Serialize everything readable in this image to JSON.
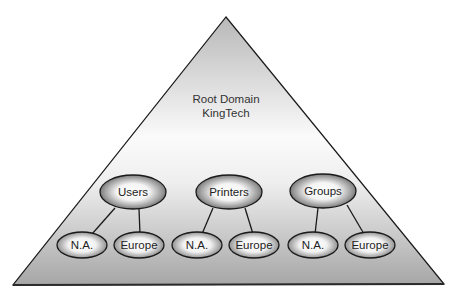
{
  "diagram": {
    "root": {
      "line1": "Root Domain",
      "line2": "KingTech"
    },
    "groups": [
      {
        "label": "Users",
        "children": [
          {
            "label": "N.A."
          },
          {
            "label": "Europe"
          }
        ]
      },
      {
        "label": "Printers",
        "children": [
          {
            "label": "N.A."
          },
          {
            "label": "Europe"
          }
        ]
      },
      {
        "label": "Groups",
        "children": [
          {
            "label": "N.A."
          },
          {
            "label": "Europe"
          }
        ]
      }
    ]
  },
  "colors": {
    "outline": "#1a1a1a",
    "triangle_top": "#bdbdbd",
    "triangle_mid": "#ffffff",
    "triangle_bottom": "#a8a8a8"
  }
}
